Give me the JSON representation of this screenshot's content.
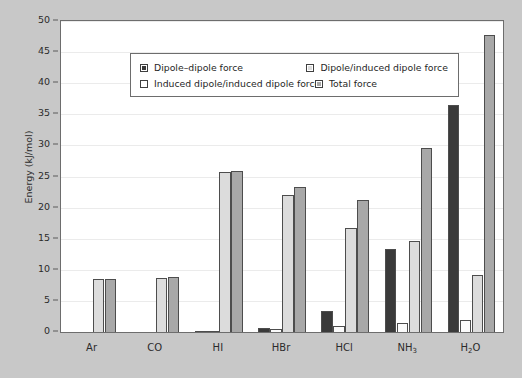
{
  "chart_data": {
    "type": "bar",
    "title": "",
    "subtitle": "",
    "xlabel": "",
    "ylabel": "Energy (kJ/mol)",
    "ylim": [
      0,
      50
    ],
    "ytick_step": 5,
    "yticks": [
      "0",
      "5",
      "10",
      "15",
      "20",
      "25",
      "30",
      "35",
      "40",
      "45",
      "50"
    ],
    "grid": true,
    "legend_position": "top-left-inside",
    "categories": [
      "Ar",
      "CO",
      "HI",
      "HBr",
      "HCl",
      "NH3",
      "H2O"
    ],
    "category_labels_html": [
      "Ar",
      "CO",
      "HI",
      "HBr",
      "HCl",
      "NH<sub>3</sub>",
      "H<sub>2</sub>O"
    ],
    "series": [
      {
        "name": "Dipole–dipole force",
        "color": "#3a3a3a",
        "values": [
          0,
          0,
          0.025,
          0.7,
          3.3,
          13.3,
          36.5
        ]
      },
      {
        "name": "Induced dipole/induced dipole force",
        "color": "#fbfbfb",
        "values": [
          0,
          0,
          0.1,
          0.5,
          0.9,
          1.5,
          2.0
        ]
      },
      {
        "name": "Dipole/induced dipole force",
        "color": "#dcdcdc",
        "values": [
          8.5,
          8.7,
          25.8,
          22.0,
          16.8,
          14.7,
          9.2
        ]
      },
      {
        "name": "Total force",
        "color": "#a8a8a8",
        "values": [
          8.5,
          8.8,
          25.9,
          23.3,
          21.2,
          29.6,
          47.8
        ]
      }
    ]
  },
  "legend": {
    "entries": [
      {
        "label": "Dipole–dipole force",
        "swatch": "dark"
      },
      {
        "label": "Dipole/induced dipole force",
        "swatch": "light"
      },
      {
        "label": "Induced dipole/induced dipole force",
        "swatch": "white"
      },
      {
        "label": "Total force",
        "swatch": "mid"
      }
    ]
  },
  "colors": {
    "background": "#c8c8c8",
    "panel": "#ffffff",
    "axis": "#6d6d6d",
    "grid": "#ebebeb",
    "text": "#2b2b2b",
    "series_dipole_dipole": "#3a3a3a",
    "series_induced_induced": "#fbfbfb",
    "series_dipole_induced": "#dcdcdc",
    "series_total": "#a8a8a8"
  }
}
